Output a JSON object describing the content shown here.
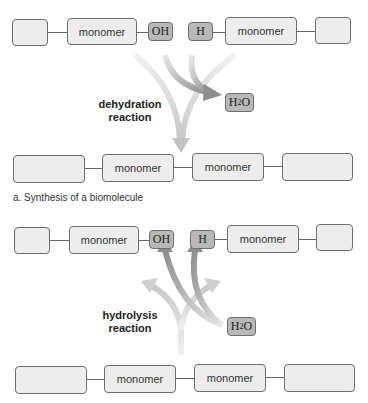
{
  "panel_a": {
    "top_row": {
      "left_chain": [
        "",
        "monomer"
      ],
      "left_group": "OH",
      "right_group": "H",
      "right_chain": [
        "monomer",
        ""
      ]
    },
    "reaction_label": [
      "dehydration",
      "reaction"
    ],
    "byproduct": {
      "base": "H",
      "sub": "2",
      "tail": "O"
    },
    "bottom_row": [
      "",
      "monomer",
      "monomer",
      ""
    ],
    "caption": "a. Synthesis of a biomolecule"
  },
  "panel_b": {
    "top_row": {
      "left_chain": [
        "",
        "monomer"
      ],
      "left_group": "OH",
      "right_group": "H",
      "right_chain": [
        "monomer",
        ""
      ]
    },
    "reaction_label": [
      "hydrolysis",
      "reaction"
    ],
    "reactant": {
      "base": "H",
      "sub": "2",
      "tail": "O"
    },
    "bottom_row": [
      "",
      "monomer",
      "monomer",
      ""
    ]
  },
  "colors": {
    "box_fill": "#ededed",
    "group_fill": "#b8b8b8",
    "light_arrow": "#d2d2d2",
    "dark_arrow": "#9a9a9a",
    "border": "#6e6e6e"
  }
}
